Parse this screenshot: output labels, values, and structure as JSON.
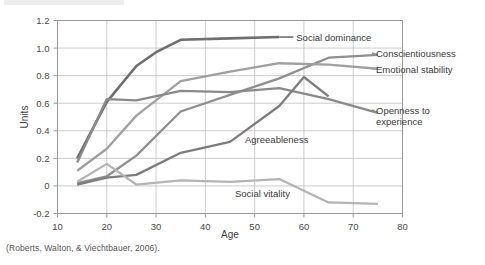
{
  "caption": "(Roberts, Walton, & Viechtbauer, 2006).",
  "chart_data": {
    "type": "line",
    "title": "",
    "xlabel": "Age",
    "ylabel": "Units",
    "xlim": [
      10,
      80
    ],
    "ylim": [
      -0.2,
      1.2
    ],
    "xticks": [
      "10",
      "20",
      "30",
      "40",
      "50",
      "60",
      "70",
      "80"
    ],
    "yticks": [
      "1.2",
      "1.0",
      "0.8",
      "0.6",
      "0.4",
      "0.2",
      "0",
      "-0.2"
    ],
    "grid": true,
    "legend_position": "inline-annotations",
    "series": [
      {
        "name": "Social dominance",
        "color": "#6e6e6e",
        "label_position": "inline-right",
        "x": [
          14,
          20,
          26,
          30,
          35,
          45,
          55
        ],
        "values": [
          0.2,
          0.61,
          0.87,
          0.97,
          1.06,
          1.07,
          1.08
        ]
      },
      {
        "name": "Conscientiousness",
        "color": "#8f8f8f",
        "label_position": "right-outside",
        "x": [
          14,
          20,
          26,
          35,
          45,
          55,
          65,
          75
        ],
        "values": [
          0.02,
          0.07,
          0.22,
          0.54,
          0.66,
          0.78,
          0.93,
          0.95
        ]
      },
      {
        "name": "Emotional stability",
        "color": "#a0a0a0",
        "label_position": "right-outside",
        "x": [
          14,
          20,
          26,
          35,
          45,
          55,
          65,
          75
        ],
        "values": [
          0.11,
          0.27,
          0.51,
          0.76,
          0.83,
          0.89,
          0.88,
          0.85
        ]
      },
      {
        "name": "Openness to experience",
        "color": "#8a8a8a",
        "label_position": "right-outside",
        "x": [
          14,
          20,
          26,
          35,
          45,
          55,
          65,
          75
        ],
        "values": [
          0.17,
          0.63,
          0.62,
          0.69,
          0.68,
          0.71,
          0.63,
          0.53
        ]
      },
      {
        "name": "Agreeableness",
        "color": "#7d7d7d",
        "label_position": "inline-below",
        "x": [
          14,
          20,
          26,
          35,
          45,
          55,
          60,
          65
        ],
        "values": [
          0.01,
          0.06,
          0.08,
          0.24,
          0.32,
          0.58,
          0.79,
          0.65
        ]
      },
      {
        "name": "Social vitality",
        "color": "#b4b4b4",
        "label_position": "inline-below",
        "x": [
          14,
          20,
          26,
          35,
          45,
          55,
          65,
          75
        ],
        "values": [
          0.03,
          0.16,
          0.01,
          0.04,
          0.03,
          0.05,
          -0.12,
          -0.13
        ]
      }
    ]
  }
}
